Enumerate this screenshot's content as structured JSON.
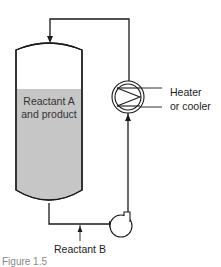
{
  "diagram": {
    "type": "process-flow",
    "tank_label_line1": "Reactant A",
    "tank_label_line2": "and product",
    "heat_exchanger_label_line1": "Heater",
    "heat_exchanger_label_line2": "or cooler",
    "feed_label": "Reactant B",
    "caption_partial": "Figure 1.5",
    "colors": {
      "line": "#1a1a1a",
      "liquid": "#c6c6c6",
      "tank_fill": "#ffffff"
    }
  }
}
